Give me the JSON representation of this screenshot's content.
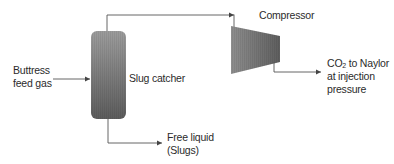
{
  "diagram": {
    "type": "process-flow",
    "nodes": {
      "feed": {
        "lines": [
          "Buttress",
          "feed gas"
        ]
      },
      "slug_catcher": {
        "label": "Slug catcher",
        "shape": "vertical-vessel"
      },
      "compressor": {
        "label": "Compressor",
        "shape": "trapezoid"
      },
      "product": {
        "prefix": "CO",
        "subscript": "2",
        "line1_suffix": " to Naylor",
        "lines_rest": [
          "at injection",
          "pressure"
        ]
      },
      "free_liquid": {
        "lines": [
          "Free liquid",
          "(Slugs)"
        ]
      }
    },
    "edges": [
      {
        "from": "feed",
        "to": "slug_catcher"
      },
      {
        "from": "slug_catcher",
        "to": "compressor"
      },
      {
        "from": "compressor",
        "to": "product"
      },
      {
        "from": "slug_catcher",
        "to": "free_liquid"
      }
    ],
    "colors": {
      "line": "#555555",
      "vessel_dark": "#5a5a5a",
      "vessel_light": "#9a9a9a",
      "text": "#2b2b2b"
    }
  }
}
